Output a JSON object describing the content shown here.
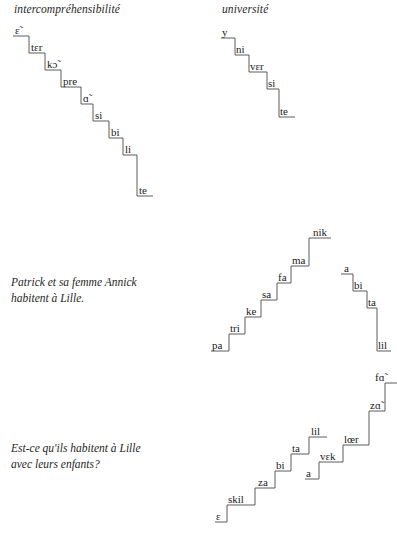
{
  "document": {
    "title": "French syllable prosody staircase diagrams",
    "ink_color": "#1a1a1a",
    "line_color": "#4a4a4a",
    "background": "#ffffff"
  },
  "blocks": [
    {
      "id": "intercomprehensibilite",
      "heading": "intercompréhensibilité",
      "gloss": "",
      "contours": [
        {
          "direction": "descending",
          "syllables": [
            "ɛ̃",
            "tɛr",
            "kɔ̃",
            "pre",
            "ɑ̃",
            "si",
            "bi",
            "li",
            "te"
          ]
        }
      ]
    },
    {
      "id": "universite",
      "heading": "université",
      "gloss": "",
      "contours": [
        {
          "direction": "descending",
          "syllables": [
            "y",
            "ni",
            "vɛr",
            "si",
            "te"
          ]
        }
      ]
    },
    {
      "id": "patrick-annick",
      "heading": "",
      "gloss": "Patrick et sa femme Annick\nhabitent à Lille.",
      "contours": [
        {
          "direction": "ascending",
          "syllables": [
            "pa",
            "tri",
            "ke",
            "sa",
            "fa",
            "ma",
            "nik"
          ]
        },
        {
          "direction": "descending",
          "syllables": [
            "a",
            "bi",
            "ta",
            "lil"
          ]
        }
      ]
    },
    {
      "id": "est-ce-quils-habitent",
      "heading": "",
      "gloss": "Est-ce qu'ils habitent à Lille\navec leurs enfants?",
      "contours": [
        {
          "direction": "ascending",
          "syllables": [
            "ɛ",
            "skil",
            "za",
            "bi",
            "ta",
            "lil"
          ]
        },
        {
          "direction": "ascending",
          "syllables": [
            "a",
            "vɛk",
            "lœr",
            "zɑ̃",
            "fɑ̃"
          ]
        }
      ]
    }
  ],
  "labels": {
    "b0c0s0": "ɛ̃",
    "b0c0s1": "tɛr",
    "b0c0s2": "kɔ̃",
    "b0c0s3": "pre",
    "b0c0s4": "ɑ̃",
    "b0c0s5": "si",
    "b0c0s6": "bi",
    "b0c0s7": "li",
    "b0c0s8": "te",
    "b1c0s0": "y",
    "b1c0s1": "ni",
    "b1c0s2": "vɛr",
    "b1c0s3": "si",
    "b1c0s4": "te",
    "b2c0s0": "pa",
    "b2c0s1": "tri",
    "b2c0s2": "ke",
    "b2c0s3": "sa",
    "b2c0s4": "fa",
    "b2c0s5": "ma",
    "b2c0s6": "nik",
    "b2c1s0": "a",
    "b2c1s1": "bi",
    "b2c1s2": "ta",
    "b2c1s3": "lil",
    "b3c0s0": "ɛ",
    "b3c0s1": "skil",
    "b3c0s2": "za",
    "b3c0s3": "bi",
    "b3c0s4": "ta",
    "b3c0s5": "lil",
    "b3c1s0": "a",
    "b3c1s1": "vɛk",
    "b3c1s2": "lœr",
    "b3c1s3": "zɑ̃",
    "b3c1s4": "fɑ̃"
  },
  "headings": {
    "intercomprehensibilite": "intercompréhensibilité",
    "universite": "université"
  },
  "glosses": {
    "patrick": "Patrick et sa femme Annick\nhabitent à Lille.",
    "estce": "Est-ce qu'ils habitent à Lille\navec leurs enfants?"
  }
}
